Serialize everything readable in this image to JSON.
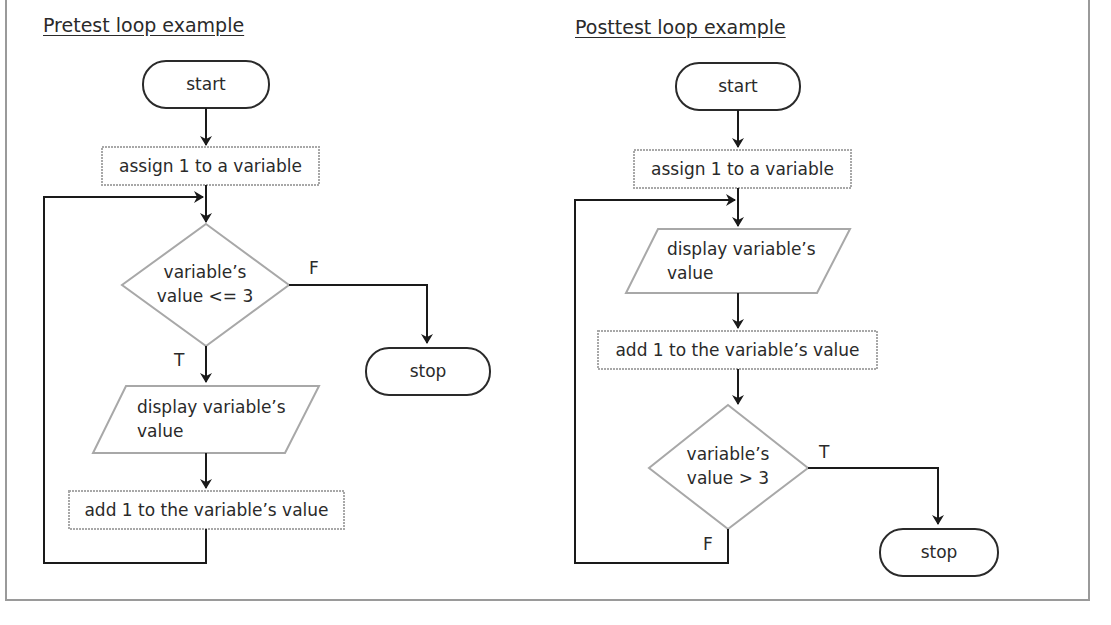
{
  "pretest": {
    "title": "Pretest loop example",
    "start": "start",
    "assign": "assign 1 to a variable",
    "decision_line1": "variable’s",
    "decision_line2": "value <= 3",
    "false_label": "F",
    "true_label": "T",
    "stop": "stop",
    "display_line1": "display variable’s",
    "display_line2": "value",
    "add": "add 1 to the variable’s value"
  },
  "posttest": {
    "title": "Posttest loop example",
    "start": "start",
    "assign": "assign 1 to a variable",
    "display_line1": "display variable’s",
    "display_line2": "value",
    "add": "add 1 to the variable’s value",
    "decision_line1": "variable’s",
    "decision_line2": "value > 3",
    "true_label": "T",
    "false_label": "F",
    "stop": "stop"
  },
  "colors": {
    "terminal_stroke": "#2a2a2a",
    "process_stroke": "#a8a8a8",
    "flow_line": "#1a1a1a",
    "frame": "#9a9a9a"
  }
}
